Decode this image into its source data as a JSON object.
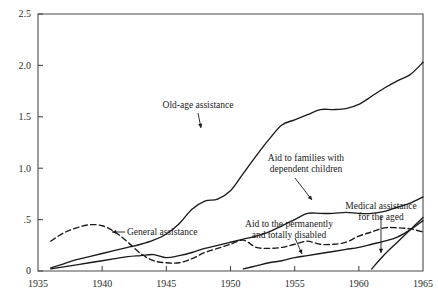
{
  "chart_data": {
    "type": "line",
    "title": "",
    "subtitle": "",
    "xlabel": "",
    "ylabel": "",
    "xlim": [
      1935,
      1965
    ],
    "ylim": [
      0,
      2.5
    ],
    "grid": false,
    "legend_position": "inline-annotations",
    "x_ticks": [
      "1935",
      "1940",
      "1945",
      "1950",
      "1955",
      "1960",
      "1965"
    ],
    "y_ticks": [
      "0",
      ".5",
      "1.0",
      "1.5",
      "2.0",
      "2.5"
    ],
    "series": [
      {
        "name": "Old-age assistance",
        "style": "solid",
        "x": [
          1936,
          1937,
          1938,
          1939,
          1940,
          1941,
          1942,
          1943,
          1944,
          1945,
          1946,
          1947,
          1948,
          1949,
          1950,
          1951,
          1952,
          1953,
          1954,
          1955,
          1956,
          1957,
          1958,
          1959,
          1960,
          1961,
          1962,
          1963,
          1964,
          1965
        ],
        "values": [
          0.03,
          0.07,
          0.11,
          0.14,
          0.17,
          0.2,
          0.23,
          0.26,
          0.3,
          0.36,
          0.46,
          0.6,
          0.68,
          0.7,
          0.78,
          0.95,
          1.12,
          1.28,
          1.42,
          1.47,
          1.52,
          1.57,
          1.57,
          1.58,
          1.62,
          1.7,
          1.78,
          1.85,
          1.91,
          2.03
        ]
      },
      {
        "name": "Aid to families with dependent children",
        "style": "solid",
        "x": [
          1936,
          1937,
          1938,
          1939,
          1940,
          1941,
          1942,
          1943,
          1944,
          1945,
          1946,
          1947,
          1948,
          1949,
          1950,
          1951,
          1952,
          1953,
          1954,
          1955,
          1956,
          1957,
          1958,
          1959,
          1960,
          1961,
          1962,
          1963,
          1964,
          1965
        ],
        "values": [
          0.02,
          0.04,
          0.06,
          0.08,
          0.1,
          0.12,
          0.14,
          0.15,
          0.16,
          0.13,
          0.15,
          0.18,
          0.22,
          0.25,
          0.28,
          0.31,
          0.34,
          0.38,
          0.44,
          0.5,
          0.56,
          0.56,
          0.56,
          0.57,
          0.56,
          0.56,
          0.58,
          0.62,
          0.66,
          0.72
        ]
      },
      {
        "name": "General assistance",
        "style": "dashed",
        "x": [
          1936,
          1937,
          1938,
          1939,
          1940,
          1941,
          1942,
          1943,
          1944,
          1945,
          1946,
          1947,
          1948,
          1949,
          1950,
          1951,
          1952,
          1953,
          1954,
          1955,
          1956,
          1957,
          1958,
          1959,
          1960,
          1961,
          1962,
          1963,
          1964,
          1965
        ],
        "values": [
          0.29,
          0.37,
          0.42,
          0.45,
          0.44,
          0.38,
          0.28,
          0.17,
          0.1,
          0.08,
          0.08,
          0.12,
          0.18,
          0.22,
          0.26,
          0.3,
          0.23,
          0.22,
          0.23,
          0.26,
          0.29,
          0.26,
          0.26,
          0.28,
          0.34,
          0.38,
          0.42,
          0.42,
          0.41,
          0.38
        ]
      },
      {
        "name": "Aid to the permanently and totally disabled",
        "style": "solid",
        "x": [
          1951,
          1952,
          1953,
          1954,
          1955,
          1956,
          1957,
          1958,
          1959,
          1960,
          1961,
          1962,
          1963,
          1964,
          1965
        ],
        "values": [
          0.02,
          0.05,
          0.08,
          0.1,
          0.13,
          0.15,
          0.17,
          0.19,
          0.21,
          0.23,
          0.26,
          0.29,
          0.33,
          0.4,
          0.49
        ]
      },
      {
        "name": "Medical assistance for the aged",
        "style": "solid",
        "x": [
          1961,
          1962,
          1963,
          1964,
          1965
        ],
        "values": [
          0.02,
          0.16,
          0.28,
          0.4,
          0.52
        ]
      }
    ],
    "annotations": [
      {
        "id": "old-age-assistance",
        "lines": [
          "Old-age assistance"
        ],
        "text_x": 198,
        "text_y": 108,
        "align": "center",
        "arrow": {
          "x1": 198,
          "y1": 113,
          "x2": 201,
          "y2": 128,
          "head": "down"
        }
      },
      {
        "id": "aid-to-families-with-dependent-children",
        "lines": [
          "Aid to families with",
          "dependent children"
        ],
        "text_x": 306,
        "text_y": 161,
        "align": "center",
        "arrow": {
          "x1": 295,
          "y1": 178,
          "x2": 312,
          "y2": 200,
          "head": "down-right"
        }
      },
      {
        "id": "general-assistance",
        "lines": [
          "General assistance"
        ],
        "text_x": 127,
        "text_y": 235,
        "align": "start",
        "arrow": {
          "x1": 125,
          "y1": 232,
          "x2": 112,
          "y2": 232,
          "head": "left"
        }
      },
      {
        "id": "aid-to-the-permanently-and-totally-disabled",
        "lines": [
          "Aid to the permanently",
          "and totally disabled"
        ],
        "text_x": 289,
        "text_y": 227,
        "align": "center",
        "arrow": {
          "x1": 295,
          "y1": 238,
          "x2": 302,
          "y2": 254,
          "head": "down-right"
        }
      },
      {
        "id": "medical-assistance-for-the-aged",
        "lines": [
          "Medical assistance",
          "for the aged"
        ],
        "text_x": 381,
        "text_y": 209,
        "align": "center",
        "arrow": {
          "x1": 381,
          "y1": 216,
          "x2": 381,
          "y2": 253,
          "head": "down"
        }
      }
    ]
  }
}
